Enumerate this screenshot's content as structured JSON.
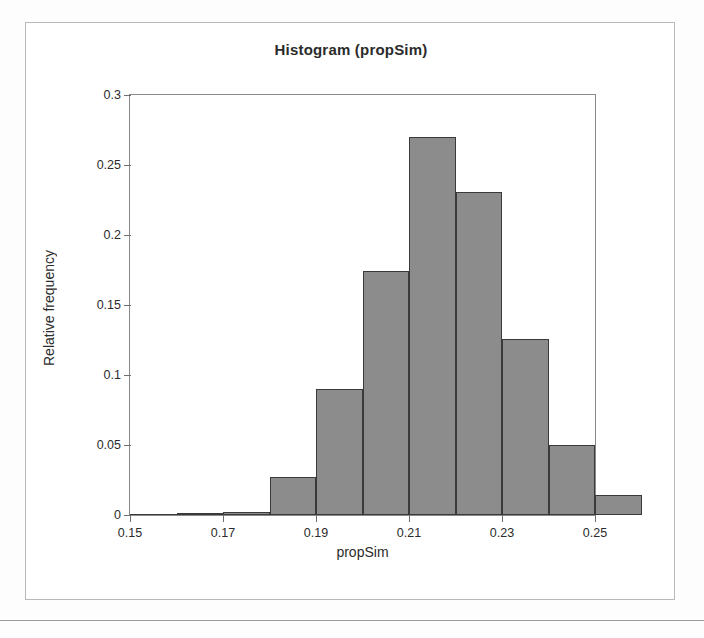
{
  "chart_data": {
    "type": "bar",
    "title": "Histogram (propSim)",
    "xlabel": "propSim",
    "ylabel": "Relative frequency",
    "xlim": [
      0.15,
      0.25
    ],
    "ylim": [
      0,
      0.3
    ],
    "grid": false,
    "legend": null,
    "xticks": [
      "0.15",
      "0.17",
      "0.19",
      "0.21",
      "0.23",
      "0.25"
    ],
    "xtick_values": [
      0.15,
      0.17,
      0.19,
      0.21,
      0.23,
      0.25
    ],
    "yticks": [
      "0",
      "0.05",
      "0.1",
      "0.15",
      "0.2",
      "0.25",
      "0.3"
    ],
    "ytick_values": [
      0,
      0.05,
      0.1,
      0.15,
      0.2,
      0.25,
      0.3
    ],
    "bin_width": 0.01,
    "bins": [
      {
        "start": 0.15,
        "end": 0.16,
        "value": 0.0
      },
      {
        "start": 0.16,
        "end": 0.17,
        "value": 0.001
      },
      {
        "start": 0.17,
        "end": 0.18,
        "value": 0.002
      },
      {
        "start": 0.18,
        "end": 0.19,
        "value": 0.027
      },
      {
        "start": 0.19,
        "end": 0.2,
        "value": 0.09
      },
      {
        "start": 0.2,
        "end": 0.21,
        "value": 0.174
      },
      {
        "start": 0.21,
        "end": 0.22,
        "value": 0.27
      },
      {
        "start": 0.22,
        "end": 0.23,
        "value": 0.231
      },
      {
        "start": 0.23,
        "end": 0.24,
        "value": 0.126
      },
      {
        "start": 0.24,
        "end": 0.25,
        "value": 0.05
      },
      {
        "start": 0.25,
        "end": 0.26,
        "value": 0.014
      }
    ],
    "categories": [
      "0.150-0.160",
      "0.160-0.170",
      "0.170-0.180",
      "0.180-0.190",
      "0.190-0.200",
      "0.200-0.210",
      "0.210-0.220",
      "0.220-0.230",
      "0.230-0.240",
      "0.240-0.250",
      "0.250-0.260"
    ],
    "values": [
      0.0,
      0.001,
      0.002,
      0.027,
      0.09,
      0.174,
      0.27,
      0.231,
      0.126,
      0.05,
      0.014
    ],
    "colors": {
      "bar_fill": "#8c8c8c",
      "bar_border": "#3a3a3a",
      "axis": "#8a8a8a",
      "text": "#2b2b2b",
      "frame": "#b9b9b9"
    }
  }
}
